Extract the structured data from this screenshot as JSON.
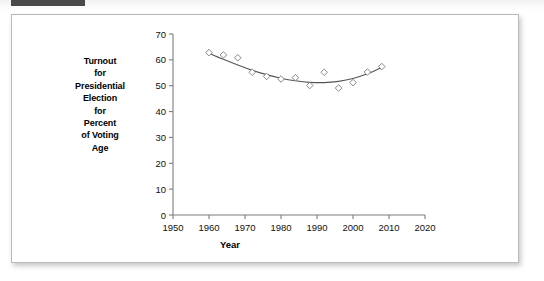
{
  "window": {
    "top_tab_color": "#4a4a4a",
    "card_border_color": "#b9b9b9"
  },
  "chart_data": {
    "type": "scatter",
    "title": "",
    "subtitle": "",
    "xlabel": "Year",
    "ylabel": "Turnout for Presidential Election for Percent of Voting Age",
    "ylabel_lines": [
      "Turnout",
      "for",
      "Presidential",
      "Election",
      "for",
      "Percent",
      "of Voting",
      "Age"
    ],
    "xlim": [
      1950,
      2020
    ],
    "ylim": [
      0,
      70
    ],
    "xticks": [
      1950,
      1960,
      1970,
      1980,
      1990,
      2000,
      2010,
      2020
    ],
    "yticks": [
      0,
      10,
      20,
      30,
      40,
      50,
      60,
      70
    ],
    "grid": false,
    "legend": "none",
    "marker": "open-diamond",
    "marker_color": "#7a7a7a",
    "line_color": "#555555",
    "x": [
      1960,
      1964,
      1968,
      1972,
      1976,
      1980,
      1984,
      1988,
      1992,
      1996,
      2000,
      2004,
      2008
    ],
    "values": [
      62.8,
      61.9,
      60.8,
      55.2,
      53.6,
      52.6,
      53.1,
      50.1,
      55.2,
      49.1,
      51.2,
      55.3,
      57.4
    ],
    "series": [
      {
        "name": "Voter turnout",
        "values": [
          62.8,
          61.9,
          60.8,
          55.2,
          53.6,
          52.6,
          53.1,
          50.1,
          55.2,
          49.1,
          51.2,
          55.3,
          57.4
        ]
      }
    ],
    "fit": {
      "type": "quadratic",
      "description": "smooth U-shaped trend curve through the scatter",
      "x": [
        1960,
        1964,
        1968,
        1972,
        1976,
        1980,
        1984,
        1988,
        1992,
        1996,
        2000,
        2004,
        2008
      ],
      "y": [
        62.6,
        60.2,
        58.0,
        56.0,
        54.3,
        52.9,
        51.9,
        51.3,
        51.2,
        51.7,
        52.8,
        54.6,
        57.1
      ]
    }
  }
}
